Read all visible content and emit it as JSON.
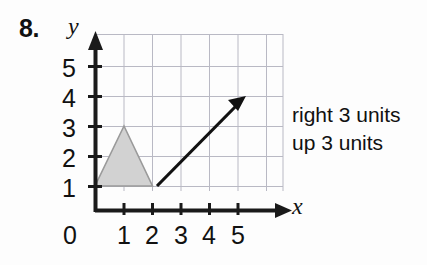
{
  "problem": {
    "number": "8."
  },
  "graph": {
    "axis_labels": {
      "x": "x",
      "y": "y"
    },
    "x_tick_labels": [
      "0",
      "1",
      "2",
      "3",
      "4",
      "5"
    ],
    "y_tick_labels": [
      "1",
      "2",
      "3",
      "4",
      "5"
    ],
    "colors": {
      "axis": "#1a1a1a",
      "grid": "#b9b9c4",
      "shape_fill": "#d2d2d2",
      "shape_stroke": "#9a9a9a",
      "vector": "#111111"
    },
    "shape": {
      "name": "triangle",
      "vertices": [
        [
          0,
          1
        ],
        [
          2,
          1
        ],
        [
          1,
          3
        ]
      ]
    },
    "vector": {
      "start": [
        2,
        1
      ],
      "end": [
        5,
        4
      ]
    },
    "axis_ranges": {
      "x": [
        0,
        6
      ],
      "y": [
        0,
        6
      ]
    }
  },
  "instructions": {
    "lines": [
      "right 3 units",
      "up 3 units"
    ]
  }
}
